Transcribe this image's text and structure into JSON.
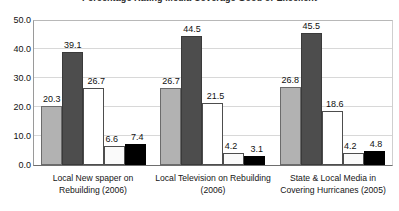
{
  "chart_data": {
    "type": "bar",
    "title": "Percentage Rating Media Coverage Good or Excellent",
    "xlabel": "",
    "ylabel": "",
    "ylim": [
      0,
      50
    ],
    "ytick_step": 10,
    "grid": true,
    "legend": "none",
    "categories": [
      "Local New spaper on Rebuilding (2006)",
      "Local Television on Rebuilding (2006)",
      "State & Local Media in Covering Hurricanes (2005)"
    ],
    "category_lines": [
      [
        "Local New spaper on",
        "Rebuilding (2006)"
      ],
      [
        "Local Television on Rebuilding",
        "(2006)"
      ],
      [
        "State & Local Media in",
        "Covering Hurricanes (2005)"
      ]
    ],
    "ytick_labels": [
      "50.0",
      "40.0",
      "30.0",
      "20.0",
      "10.0",
      "0.0"
    ],
    "ytick_values": [
      50,
      40,
      30,
      20,
      10,
      0
    ],
    "series": [
      {
        "name": "Series 1",
        "color": "#b2b2b2",
        "values": [
          20.3,
          26.7,
          26.8
        ]
      },
      {
        "name": "Series 2",
        "color": "#4d4d4d",
        "values": [
          39.1,
          44.5,
          45.5
        ]
      },
      {
        "name": "Series 3",
        "color": "#ffffff",
        "values": [
          26.7,
          21.5,
          18.6
        ]
      },
      {
        "name": "Series 4",
        "color": "#fafafa",
        "values": [
          6.6,
          4.2,
          4.2
        ]
      },
      {
        "name": "Series 5",
        "color": "#000000",
        "values": [
          7.4,
          3.1,
          4.8
        ]
      }
    ],
    "bar_labels": [
      [
        "20.3",
        "39.1",
        "26.7",
        "6.6",
        "7.4"
      ],
      [
        "26.7",
        "44.5",
        "21.5",
        "4.2",
        "3.1"
      ],
      [
        "26.8",
        "45.5",
        "18.6",
        "4.2",
        "4.8"
      ]
    ]
  }
}
